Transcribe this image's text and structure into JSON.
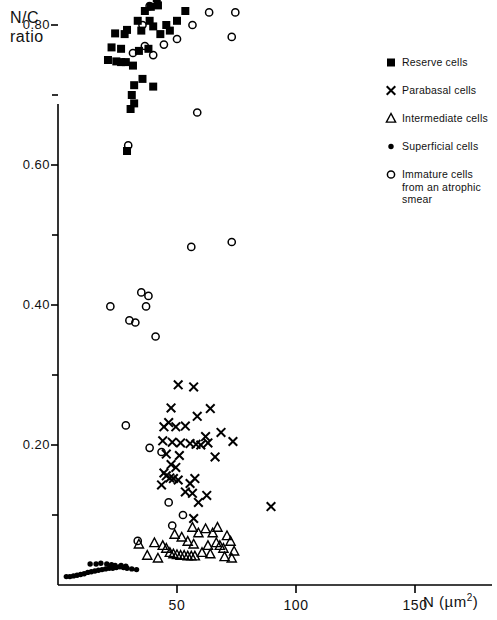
{
  "chart_data": {
    "type": "scatter",
    "title": "",
    "ylabel": "N/C\nratio",
    "ylabel_line1": "N/C",
    "ylabel_line2": "ratio",
    "xlabel": "N (µm2)",
    "xlabel_main": "N",
    "xlabel_unit_open": "(µm",
    "xlabel_unit_exp": "2",
    "xlabel_unit_close": ")",
    "xlim": [
      0,
      178
    ],
    "ylim": [
      0,
      1.05
    ],
    "xticks": [
      50,
      100,
      150
    ],
    "xtick_labels": [
      "50",
      "100",
      "150"
    ],
    "yticks": [
      0.2,
      0.4,
      0.6,
      0.8,
      1.0
    ],
    "ytick_labels": [
      "0.20",
      "0.40",
      "0.60",
      "0.80",
      "1.00"
    ],
    "y_minor_ticks": [
      0.1,
      0.3,
      0.5,
      0.7,
      0.9
    ],
    "grid": false,
    "legend_position": "top-right",
    "marker_color": "#000000",
    "axis_color": "#000000",
    "background": "#ffffff",
    "series": [
      {
        "name": "Reserve cells",
        "marker": "filled-square",
        "points": [
          [
            28.5,
            0.935
          ],
          [
            31.5,
            0.893
          ],
          [
            34.0,
            0.862
          ],
          [
            31.0,
            0.845
          ],
          [
            37.5,
            0.846
          ],
          [
            40.5,
            0.845
          ],
          [
            41.5,
            0.838
          ],
          [
            42.0,
            0.828
          ],
          [
            39.0,
            0.826
          ],
          [
            36.5,
            0.82
          ],
          [
            33.5,
            0.806
          ],
          [
            38.5,
            0.806
          ],
          [
            40.0,
            0.798
          ],
          [
            29.0,
            0.793
          ],
          [
            35.0,
            0.792
          ],
          [
            24.0,
            0.788
          ],
          [
            28.0,
            0.787
          ],
          [
            45.5,
            0.8
          ],
          [
            50.0,
            0.806
          ],
          [
            53.5,
            0.82
          ],
          [
            47.0,
            0.792
          ],
          [
            43.0,
            0.787
          ],
          [
            22.5,
            0.768
          ],
          [
            26.5,
            0.766
          ],
          [
            34.0,
            0.763
          ],
          [
            38.0,
            0.766
          ],
          [
            21.0,
            0.75
          ],
          [
            24.5,
            0.748
          ],
          [
            26.5,
            0.747
          ],
          [
            28.5,
            0.747
          ],
          [
            31.5,
            0.742
          ],
          [
            35.5,
            0.723
          ],
          [
            32.0,
            0.714
          ],
          [
            40.0,
            0.712
          ],
          [
            31.0,
            0.7
          ],
          [
            32.0,
            0.688
          ],
          [
            30.5,
            0.68
          ],
          [
            29.0,
            0.62
          ]
        ]
      },
      {
        "name": "Parabasal cells",
        "marker": "x",
        "points": [
          [
            50.5,
            0.286
          ],
          [
            57.0,
            0.283
          ],
          [
            47.5,
            0.253
          ],
          [
            64.0,
            0.252
          ],
          [
            58.5,
            0.241
          ],
          [
            46.5,
            0.232
          ],
          [
            44.5,
            0.226
          ],
          [
            49.5,
            0.226
          ],
          [
            53.5,
            0.227
          ],
          [
            68.5,
            0.218
          ],
          [
            62.0,
            0.212
          ],
          [
            44.0,
            0.206
          ],
          [
            48.0,
            0.204
          ],
          [
            51.5,
            0.203
          ],
          [
            55.5,
            0.202
          ],
          [
            58.0,
            0.201
          ],
          [
            60.0,
            0.2
          ],
          [
            63.0,
            0.203
          ],
          [
            73.5,
            0.205
          ],
          [
            45.5,
            0.187
          ],
          [
            51.0,
            0.185
          ],
          [
            66.0,
            0.183
          ],
          [
            47.5,
            0.172
          ],
          [
            49.5,
            0.168
          ],
          [
            44.5,
            0.16
          ],
          [
            45.5,
            0.156
          ],
          [
            47.0,
            0.153
          ],
          [
            48.5,
            0.152
          ],
          [
            50.5,
            0.15
          ],
          [
            43.5,
            0.143
          ],
          [
            55.5,
            0.145
          ],
          [
            57.5,
            0.152
          ],
          [
            53.5,
            0.133
          ],
          [
            56.5,
            0.131
          ],
          [
            62.5,
            0.128
          ],
          [
            59.0,
            0.118
          ],
          [
            89.5,
            0.112
          ],
          [
            57.0,
            0.095
          ]
        ]
      },
      {
        "name": "Intermediate cells",
        "marker": "open-triangle",
        "points": [
          [
            40.5,
            0.06
          ],
          [
            42.0,
            0.038
          ],
          [
            44.0,
            0.056
          ],
          [
            45.5,
            0.052
          ],
          [
            47.0,
            0.046
          ],
          [
            48.5,
            0.044
          ],
          [
            50.0,
            0.043
          ],
          [
            51.5,
            0.042
          ],
          [
            53.0,
            0.042
          ],
          [
            54.5,
            0.041
          ],
          [
            56.0,
            0.041
          ],
          [
            57.5,
            0.041
          ],
          [
            49.0,
            0.072
          ],
          [
            52.0,
            0.068
          ],
          [
            54.5,
            0.062
          ],
          [
            57.0,
            0.058
          ],
          [
            56.5,
            0.082
          ],
          [
            59.0,
            0.074
          ],
          [
            60.5,
            0.046
          ],
          [
            63.0,
            0.056
          ],
          [
            65.0,
            0.074
          ],
          [
            66.5,
            0.06
          ],
          [
            68.0,
            0.056
          ],
          [
            69.5,
            0.052
          ],
          [
            71.0,
            0.07
          ],
          [
            72.5,
            0.062
          ],
          [
            74.0,
            0.048
          ],
          [
            34.0,
            0.058
          ],
          [
            37.5,
            0.042
          ],
          [
            62.0,
            0.08
          ],
          [
            64.0,
            0.044
          ],
          [
            67.0,
            0.082
          ],
          [
            70.0,
            0.04
          ],
          [
            73.0,
            0.038
          ]
        ]
      },
      {
        "name": "Superficial cells",
        "marker": "filled-dot",
        "points": [
          [
            3.5,
            0.012
          ],
          [
            5.0,
            0.012
          ],
          [
            6.5,
            0.013
          ],
          [
            8.0,
            0.014
          ],
          [
            9.5,
            0.015
          ],
          [
            11.0,
            0.016
          ],
          [
            12.5,
            0.018
          ],
          [
            14.0,
            0.019
          ],
          [
            15.5,
            0.02
          ],
          [
            17.0,
            0.021
          ],
          [
            18.5,
            0.022
          ],
          [
            20.0,
            0.023
          ],
          [
            21.5,
            0.024
          ],
          [
            23.0,
            0.024
          ],
          [
            24.5,
            0.025
          ],
          [
            26.0,
            0.026
          ],
          [
            27.5,
            0.025
          ],
          [
            29.0,
            0.024
          ],
          [
            31.0,
            0.023
          ],
          [
            33.0,
            0.022
          ],
          [
            13.5,
            0.03
          ],
          [
            16.0,
            0.03
          ],
          [
            18.0,
            0.031
          ],
          [
            20.5,
            0.03
          ],
          [
            22.5,
            0.029
          ],
          [
            24.0,
            0.028
          ],
          [
            26.5,
            0.028
          ],
          [
            28.5,
            0.027
          ]
        ]
      },
      {
        "name": "Immature cells from an atrophic smear",
        "marker": "open-circle",
        "points": [
          [
            38.5,
            0.827
          ],
          [
            35.5,
            0.8
          ],
          [
            52.5,
            0.848
          ],
          [
            64.5,
            0.846
          ],
          [
            63.5,
            0.818
          ],
          [
            74.5,
            0.818
          ],
          [
            73.0,
            0.783
          ],
          [
            56.5,
            0.8
          ],
          [
            50.0,
            0.78
          ],
          [
            36.5,
            0.77
          ],
          [
            44.5,
            0.772
          ],
          [
            31.5,
            0.76
          ],
          [
            40.0,
            0.757
          ],
          [
            58.5,
            0.675
          ],
          [
            29.5,
            0.628
          ],
          [
            56.0,
            0.483
          ],
          [
            73.0,
            0.49
          ],
          [
            22.0,
            0.398
          ],
          [
            35.0,
            0.418
          ],
          [
            38.0,
            0.413
          ],
          [
            37.0,
            0.398
          ],
          [
            30.0,
            0.378
          ],
          [
            32.5,
            0.375
          ],
          [
            41.0,
            0.355
          ],
          [
            28.5,
            0.228
          ],
          [
            38.5,
            0.196
          ],
          [
            43.5,
            0.19
          ],
          [
            46.5,
            0.118
          ],
          [
            52.5,
            0.1
          ],
          [
            48.0,
            0.085
          ],
          [
            33.5,
            0.063
          ]
        ]
      }
    ]
  },
  "legend": {
    "items": [
      {
        "label": "Reserve cells",
        "marker": "filled-square"
      },
      {
        "label": "Parabasal cells",
        "marker": "x"
      },
      {
        "label": "Intermediate cells",
        "marker": "open-triangle"
      },
      {
        "label": "Superficial cells",
        "marker": "filled-dot"
      },
      {
        "label": "Immature cells from an atrophic smear",
        "marker": "open-circle"
      }
    ]
  }
}
